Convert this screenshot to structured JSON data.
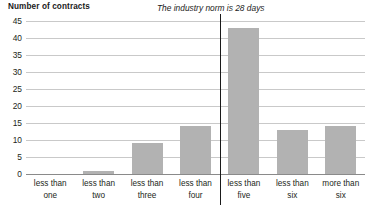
{
  "chart_data": {
    "type": "bar",
    "title": "",
    "xlabel": "",
    "ylabel": "Number of contracts",
    "categories": [
      "less than one",
      "less than two",
      "less than three",
      "less than four",
      "less than five",
      "less than six",
      "more than six"
    ],
    "category_lines": [
      [
        "less than",
        "one"
      ],
      [
        "less than",
        "two"
      ],
      [
        "less than",
        "three"
      ],
      [
        "less than",
        "four"
      ],
      [
        "less than",
        "five"
      ],
      [
        "less than",
        "six"
      ],
      [
        "more than",
        "six"
      ]
    ],
    "values": [
      0,
      1,
      9,
      14,
      43,
      13,
      14
    ],
    "ylim": [
      0,
      45
    ],
    "ytick_step": 5,
    "yticks": [
      0,
      5,
      10,
      15,
      20,
      25,
      30,
      35,
      40,
      45
    ],
    "ytick_labels": [
      "0",
      "5",
      "10",
      "15",
      "20",
      "25",
      "30",
      "35",
      "40",
      "45"
    ],
    "grid": true,
    "legend": "none",
    "annotations": [
      {
        "text": "The industry norm is 28 days",
        "style": "italic",
        "marker": "vertical-divider",
        "between_categories": [
          "less than four",
          "less than five"
        ]
      }
    ],
    "bar_color": "#b2b2b2",
    "gridline_color": "#c9c9c9",
    "axis_color": "#8a8a8a",
    "divider_color": "#1a1a1a",
    "text_color": "#231f20"
  }
}
